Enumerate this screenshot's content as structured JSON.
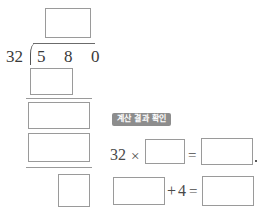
{
  "worksheet": {
    "division": {
      "divisor": "32",
      "bracket_icon": "division-bracket-icon",
      "dividend_digits": [
        "5",
        "8",
        "0"
      ],
      "quotient_placeholder": "",
      "partial_product_1_placeholder": "",
      "partial_remainder_placeholder": "",
      "partial_product_2_placeholder": "",
      "final_remainder_placeholder": ""
    },
    "check_section": {
      "badge_label": "계산 결과 확인",
      "equation_1": {
        "operand": "32",
        "multiply_symbol": "×",
        "factor_placeholder": "",
        "equals_symbol": "=",
        "product_placeholder": "",
        "trailing_mark": ","
      },
      "equation_2": {
        "addend_placeholder": "",
        "plus_symbol": "+",
        "addend_value": "4",
        "equals_symbol": "=",
        "sum_placeholder": ""
      }
    }
  }
}
